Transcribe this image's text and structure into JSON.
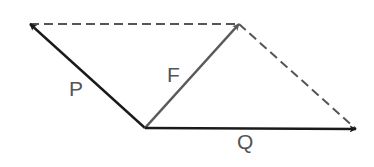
{
  "diagram": {
    "origin": {
      "x": 145,
      "y": 128
    },
    "vectors": [
      {
        "id": "P",
        "label": "P",
        "tip": {
          "x": 30,
          "y": 24
        },
        "color": "#1a1a1a",
        "label_pos": {
          "x": 69,
          "y": 96
        }
      },
      {
        "id": "F",
        "label": "F",
        "tip": {
          "x": 239,
          "y": 24
        },
        "color": "#5a5a5a",
        "label_pos": {
          "x": 167,
          "y": 82
        }
      },
      {
        "id": "Q",
        "label": "Q",
        "tip": {
          "x": 356,
          "y": 129
        },
        "color": "#1a1a1a",
        "label_pos": {
          "x": 237,
          "y": 149
        }
      }
    ],
    "dashed_edges": [
      {
        "from": {
          "x": 30,
          "y": 24
        },
        "to": {
          "x": 239,
          "y": 24
        }
      },
      {
        "from": {
          "x": 239,
          "y": 24
        },
        "to": {
          "x": 356,
          "y": 129
        }
      }
    ],
    "dashed_color": "#555555"
  }
}
